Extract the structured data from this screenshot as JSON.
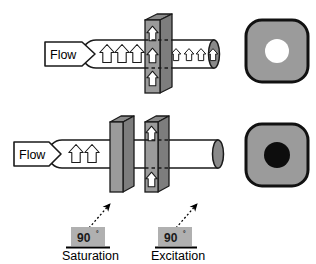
{
  "diagram": {
    "background": "#ffffff",
    "colors": {
      "slab_front": "#9b9b9b",
      "slab_side": "#7d7d7d",
      "slab_top": "#8a8a8a",
      "outline": "#000000",
      "image_fill": "#9b9b9b",
      "tube_cap": "#8a8a8a",
      "signal_bright": "#ffffff",
      "signal_dark": "#0d0d0d",
      "pulse_box": "#b0b0b0"
    },
    "panels": [
      {
        "id": "top-panel",
        "name": "inflow-enhancement-panel",
        "flow_label": "Flow",
        "tube": {
          "spins_upstream": 3,
          "spins_in_slab": 1,
          "spins_downstream": 4,
          "spin_glyph": "up-arrow"
        },
        "slabs": [
          {
            "name": "excitation-slab",
            "arrows_outside": 2,
            "arrow_inside": 1,
            "dashed_lines": 2
          }
        ],
        "signal_image": {
          "name": "bright-signal-image",
          "shape": "rounded-square",
          "vessel": "bright",
          "vessel_fill": "#ffffff"
        }
      },
      {
        "id": "bottom-panel",
        "name": "saturation-panel",
        "flow_label": "Flow",
        "tube": {
          "spins_upstream": 2,
          "spins_in_slab": 0,
          "spins_downstream": 0,
          "spin_glyph": "up-arrow"
        },
        "slabs": [
          {
            "name": "saturation-slab",
            "arrows_outside": 0,
            "arrow_inside": 0,
            "dashed_lines": 0
          },
          {
            "name": "excitation-slab",
            "arrows_outside": 2,
            "arrow_inside": 0,
            "dashed_lines": 2
          }
        ],
        "signal_image": {
          "name": "dark-signal-image",
          "shape": "rounded-square",
          "vessel": "dark",
          "vessel_fill": "#0d0d0d"
        }
      }
    ],
    "pulse_labels": [
      {
        "name": "saturation-pulse",
        "angle": "90",
        "degree_symbol": "°",
        "caption": "Saturation",
        "pointer": "dotted-arrow-up-right"
      },
      {
        "name": "excitation-pulse",
        "angle": "90",
        "degree_symbol": "°",
        "caption": "Excitation",
        "pointer": "dotted-arrow-up-right"
      }
    ]
  }
}
